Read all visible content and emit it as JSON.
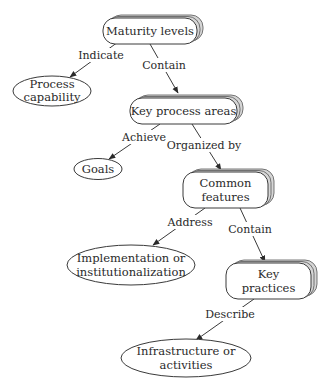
{
  "diagram": {
    "type": "concept-map",
    "colors": {
      "stroke": "#3a3a3a",
      "shadow": "#d6d6d6",
      "text": "#2a2a2a",
      "background": "#ffffff"
    },
    "nodes": {
      "maturity_levels": {
        "line1": "Maturity levels",
        "shape": "stacked-rounded-box"
      },
      "process_capability": {
        "line1": "Process",
        "line2": "capability",
        "shape": "ellipse"
      },
      "key_process_areas": {
        "line1": "Key process areas",
        "shape": "stacked-rounded-box"
      },
      "goals": {
        "line1": "Goals",
        "shape": "ellipse"
      },
      "common_features": {
        "line1": "Common",
        "line2": "features",
        "shape": "stacked-rounded-box"
      },
      "implementation": {
        "line1": "Implementation or",
        "line2": "institutionalization",
        "shape": "ellipse"
      },
      "key_practices": {
        "line1": "Key",
        "line2": "practices",
        "shape": "stacked-rounded-box"
      },
      "infrastructure": {
        "line1": "Infrastructure or",
        "line2": "activities",
        "shape": "ellipse"
      }
    },
    "edges": {
      "indicate": {
        "label": "Indicate",
        "from": "Maturity levels",
        "to": "Process capability"
      },
      "contain_1": {
        "label": "Contain",
        "from": "Maturity levels",
        "to": "Key process areas"
      },
      "achieve": {
        "label": "Achieve",
        "from": "Key process areas",
        "to": "Goals"
      },
      "organized_by": {
        "label": "Organized by",
        "from": "Key process areas",
        "to": "Common features"
      },
      "address": {
        "label": "Address",
        "from": "Common features",
        "to": "Implementation or institutionalization"
      },
      "contain_2": {
        "label": "Contain",
        "from": "Common features",
        "to": "Key practices"
      },
      "describe": {
        "label": "Describe",
        "from": "Key practices",
        "to": "Infrastructure or activities"
      }
    }
  }
}
